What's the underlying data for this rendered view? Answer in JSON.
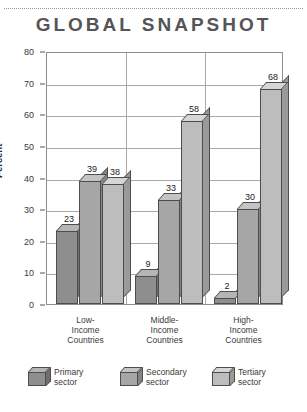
{
  "header": {
    "title": "GLOBAL SNAPSHOT"
  },
  "chart_data": {
    "type": "bar",
    "title": "GLOBAL SNAPSHOT",
    "xlabel": "",
    "ylabel": "Percent",
    "ylim": [
      0,
      80
    ],
    "ytick_labels": [
      "0",
      "10",
      "20",
      "30",
      "40",
      "50",
      "60",
      "70",
      "80"
    ],
    "ytick_values": [
      0,
      10,
      20,
      30,
      40,
      50,
      60,
      70,
      80
    ],
    "grid": true,
    "legend_position": "bottom",
    "categories": [
      "Low-Income Countries",
      "Middle-Income Countries",
      "High-Income Countries"
    ],
    "category_lines": [
      [
        "Low-",
        "Income",
        "Countries"
      ],
      [
        "Middle-",
        "Income",
        "Countries"
      ],
      [
        "High-",
        "Income",
        "Countries"
      ]
    ],
    "series": [
      {
        "name": "Primary sector",
        "values": [
          23,
          9,
          2
        ],
        "color": "#8e8e8e"
      },
      {
        "name": "Secondary sector",
        "values": [
          39,
          33,
          30
        ],
        "color": "#a6a6a6"
      },
      {
        "name": "Tertiary sector",
        "values": [
          38,
          58,
          68
        ],
        "color": "#bdbdbd"
      }
    ]
  },
  "legend": [
    {
      "label_line1": "Primary",
      "label_line2": "sector"
    },
    {
      "label_line1": "Secondary",
      "label_line2": "sector"
    },
    {
      "label_line1": "Tertiary",
      "label_line2": "sector"
    }
  ],
  "caption": ""
}
